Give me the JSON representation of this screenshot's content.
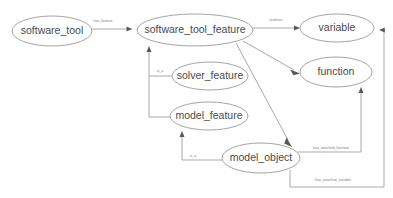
{
  "diagram": {
    "background_color": "#ffffff",
    "node_fill": "#ffffff",
    "node_stroke": "#9a9a9a",
    "node_text_color": "#4a4a4a",
    "edge_color": "#9a9a9a",
    "arrowhead_color": "#585858",
    "edge_label_color": "#7d7d7d"
  },
  "nodes": [
    {
      "id": "software_tool",
      "label": "software_tool",
      "cx": 52,
      "cy": 31,
      "rx": 40,
      "ry": 15
    },
    {
      "id": "software_tool_feature",
      "label": "software_tool_feature",
      "cx": 195,
      "cy": 30,
      "rx": 58,
      "ry": 16
    },
    {
      "id": "variable",
      "label": "variable",
      "cx": 337,
      "cy": 28,
      "rx": 37,
      "ry": 14
    },
    {
      "id": "function",
      "label": "function",
      "cx": 336,
      "cy": 72,
      "rx": 36,
      "ry": 15
    },
    {
      "id": "solver_feature",
      "label": "solver_feature",
      "cx": 210,
      "cy": 76,
      "rx": 38,
      "ry": 14
    },
    {
      "id": "model_feature",
      "label": "model_feature",
      "cx": 209,
      "cy": 116,
      "rx": 39,
      "ry": 14
    },
    {
      "id": "model_object",
      "label": "model_object",
      "cx": 261,
      "cy": 158,
      "rx": 39,
      "ry": 15
    }
  ],
  "edges": [
    {
      "id": "has_feature",
      "label": "has_feature",
      "source": "software_tool",
      "target": "software_tool_feature",
      "label_x": 103,
      "label_y": 21
    },
    {
      "id": "involves",
      "label": "involves",
      "source": "software_tool_feature",
      "target": "variable",
      "label_x": 276,
      "label_y": 20
    },
    {
      "id": "stf_to_function",
      "label": "",
      "source": "software_tool_feature",
      "target": "function",
      "label_x": 0,
      "label_y": 0
    },
    {
      "id": "stf_to_model_object",
      "label": "",
      "source": "software_tool_feature",
      "target": "model_object",
      "label_x": 0,
      "label_y": 0
    },
    {
      "id": "solver_is_a",
      "label": "is_a",
      "source": "solver_feature",
      "target": "software_tool_feature",
      "label_x": 160,
      "label_y": 71
    },
    {
      "id": "model_feature_is_a",
      "label": "is_a",
      "source": "model_feature",
      "target": "software_tool_feature",
      "label_x": 160,
      "label_y": 71
    },
    {
      "id": "model_object_is_a",
      "label": "is_a",
      "source": "model_object",
      "target": "model_feature",
      "label_x": 193,
      "label_y": 156
    },
    {
      "id": "has_attached_function",
      "label": "has_attached_function",
      "source": "model_object",
      "target": "function",
      "label_x": 331,
      "label_y": 155
    },
    {
      "id": "has_attached_variable",
      "label": "has_attached_variable",
      "source": "model_object",
      "target": "variable",
      "label_x": 333,
      "label_y": 180
    }
  ]
}
